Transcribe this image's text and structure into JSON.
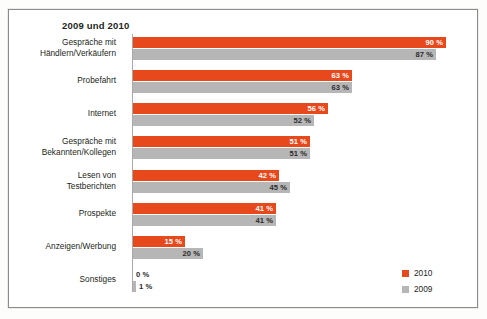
{
  "figure": {
    "title": "2009 und 2010"
  },
  "legend": {
    "entries": [
      {
        "label": "2010",
        "color": "#e8491c",
        "swatch_name": "legend-swatch-2010"
      },
      {
        "label": "2009",
        "color": "#b6b6b6",
        "swatch_name": "legend-swatch-2009"
      }
    ]
  },
  "rows": [
    {
      "label_lines": [
        "Gespräche mit",
        "Händlern/Verkäufern"
      ],
      "v2010": "90 %",
      "v2009": "87 %"
    },
    {
      "label_lines": [
        "Probefahrt"
      ],
      "v2010": "63 %",
      "v2009": "63 %"
    },
    {
      "label_lines": [
        "Internet"
      ],
      "v2010": "56 %",
      "v2009": "52 %"
    },
    {
      "label_lines": [
        "Gespräche mit",
        "Bekannten/Kollegen"
      ],
      "v2010": "51 %",
      "v2009": "51 %"
    },
    {
      "label_lines": [
        "Lesen von",
        "Testberichten"
      ],
      "v2010": "42 %",
      "v2009": "45 %"
    },
    {
      "label_lines": [
        "Prospekte"
      ],
      "v2010": "41 %",
      "v2009": "41 %"
    },
    {
      "label_lines": [
        "Anzeigen/Werbung"
      ],
      "v2010": "15 %",
      "v2009": "20 %"
    },
    {
      "label_lines": [
        "Sonstiges"
      ],
      "v2010": "0 %",
      "v2009": "1 %"
    }
  ],
  "chart_data": {
    "type": "bar",
    "orientation": "horizontal",
    "title": "2009 und 2010",
    "xlabel": "",
    "ylabel": "",
    "xlim": [
      0,
      100
    ],
    "unit": "%",
    "grid": false,
    "legend_position": "bottom-right",
    "categories": [
      "Gespräche mit Händlern/Verkäufern",
      "Probefahrt",
      "Internet",
      "Gespräche mit Bekannten/Kollegen",
      "Lesen von Testberichten",
      "Prospekte",
      "Anzeigen/Werbung",
      "Sonstiges"
    ],
    "series": [
      {
        "name": "2010",
        "color": "#e8491c",
        "values": [
          90,
          63,
          56,
          51,
          42,
          41,
          15,
          0
        ]
      },
      {
        "name": "2009",
        "color": "#b6b6b6",
        "values": [
          87,
          63,
          52,
          51,
          45,
          41,
          20,
          1
        ]
      }
    ]
  }
}
